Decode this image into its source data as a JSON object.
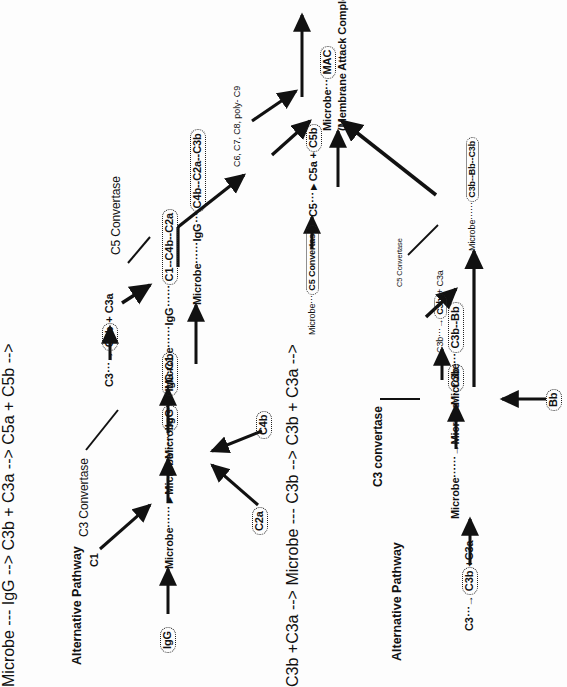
{
  "figure": {
    "kind": "complement-activation-pathway-diagram",
    "orientation": "rotated-90-ccw",
    "background": "#fdfdfd",
    "ink": "#111111"
  },
  "classical": {
    "title": "Alternative Pathway",
    "nodes": {
      "igg_start": "IgG",
      "microbe_to_microbe_igg_pre": "Microbe",
      "microbe_to_microbe_igg_arrow": "Microbe",
      "microbe_igg_chip": "IgG",
      "c1_label": "C1",
      "microbe_igg_c1_pre": "Microbe",
      "igg_c1_chip": "IgG-C1",
      "c2a": "C2a",
      "c4b": "C4b",
      "c3_convertase_label": "C3 Convertase",
      "microbe_igg_pre2": "Microbe",
      "igg_mid2": "IgG",
      "c1_c4b_c2a_chip": "C1--C4b--C2a",
      "c3_label": "C3",
      "c3b_chip": "C3b",
      "plus_c3a": "+ C3a",
      "microbe_igg_pre3": "Microbe",
      "igg_mid3": "IgG",
      "c4b_c2a_c3b_chip": "C4b--C2a--C3b",
      "c5_convertase_label": "C5 Convertase",
      "microbe_c5conv_pre": "Microbe",
      "c5_convertase_chip": "C5 Convertase",
      "c5_label": "C5",
      "c5a_plus": "C5a +",
      "c5b_chip": "C5b",
      "c6_c9_label": "C6, C7, C8, poly- C9",
      "microbe_mac_pre": "Microbe",
      "mac_chip": "MAC",
      "mac_expansion": "(Membrane Attack Complex)"
    }
  },
  "alternative": {
    "title": "Alternative Pathway",
    "nodes": {
      "c3_label": "C3",
      "c3b_chip": "C3b",
      "plus_c3a": "+C3a",
      "microbe_pre": "Microbe",
      "microbe_bold": "Microbe",
      "c3b_chip2": "C3b",
      "microbe_c3b_bb_pre": "Microbe",
      "c3b_bb_chip": "C3b--Bb",
      "c3_convertase_label": "C3 convertase",
      "bb_chip": "Bb",
      "c3b_small": "C3b",
      "c3b_chip3": "C3b",
      "plus_c3a_small": "+ C3a",
      "c5_convertase_label": "C5 Convertase",
      "microbe_c5_pre": "Microbe",
      "c3b_bb_c3b_chip": "C3b--Bb--C3b"
    }
  }
}
